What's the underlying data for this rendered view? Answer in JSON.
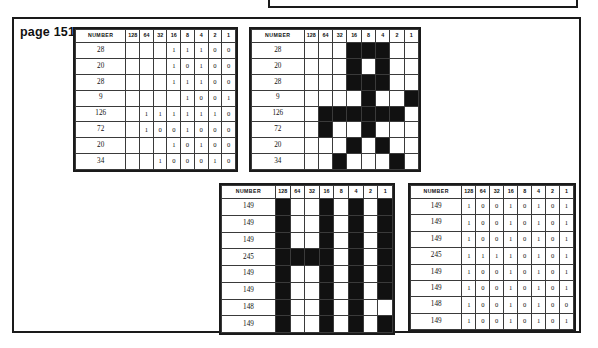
{
  "page": {
    "label_prefix": "page",
    "label_number": "151"
  },
  "columns": {
    "number_header": "NUMBER",
    "bits": [
      "128",
      "64",
      "32",
      "16",
      "8",
      "4",
      "2",
      "1"
    ]
  },
  "tables": [
    {
      "id": "top-left-binary",
      "kind": "binary-values",
      "numbers": [
        "28",
        "20",
        "28",
        "9",
        "126",
        "72",
        "20",
        "34"
      ],
      "rows": [
        [
          "",
          "",
          "",
          "1",
          "1",
          "1",
          "0",
          "0"
        ],
        [
          "",
          "",
          "",
          "1",
          "0",
          "1",
          "0",
          "0"
        ],
        [
          "",
          "",
          "",
          "1",
          "1",
          "1",
          "0",
          "0"
        ],
        [
          "",
          "",
          "",
          "",
          "1",
          "0",
          "0",
          "1"
        ],
        [
          "",
          "1",
          "1",
          "1",
          "1",
          "1",
          "1",
          "0"
        ],
        [
          "",
          "1",
          "0",
          "0",
          "1",
          "0",
          "0",
          "0"
        ],
        [
          "",
          "",
          "",
          "1",
          "0",
          "1",
          "0",
          "0"
        ],
        [
          "",
          "",
          "1",
          "0",
          "0",
          "0",
          "1",
          "0"
        ]
      ]
    },
    {
      "id": "top-right-pixels",
      "kind": "pixel-grid",
      "numbers": [
        "28",
        "20",
        "28",
        "9",
        "126",
        "72",
        "20",
        "34"
      ],
      "rows": [
        [
          0,
          0,
          0,
          1,
          1,
          1,
          0,
          0
        ],
        [
          0,
          0,
          0,
          1,
          0,
          1,
          0,
          0
        ],
        [
          0,
          0,
          0,
          1,
          1,
          1,
          0,
          0
        ],
        [
          0,
          0,
          0,
          0,
          1,
          0,
          0,
          1
        ],
        [
          0,
          1,
          1,
          1,
          1,
          1,
          1,
          0
        ],
        [
          0,
          1,
          0,
          0,
          1,
          0,
          0,
          0
        ],
        [
          0,
          0,
          0,
          1,
          0,
          1,
          0,
          0
        ],
        [
          0,
          0,
          1,
          0,
          0,
          0,
          1,
          0
        ]
      ]
    },
    {
      "id": "bottom-left-pixels",
      "kind": "pixel-grid",
      "numbers": [
        "149",
        "149",
        "149",
        "245",
        "149",
        "149",
        "148",
        "149"
      ],
      "rows": [
        [
          1,
          0,
          0,
          1,
          0,
          1,
          0,
          1
        ],
        [
          1,
          0,
          0,
          1,
          0,
          1,
          0,
          1
        ],
        [
          1,
          0,
          0,
          1,
          0,
          1,
          0,
          1
        ],
        [
          1,
          1,
          1,
          1,
          0,
          1,
          0,
          1
        ],
        [
          1,
          0,
          0,
          1,
          0,
          1,
          0,
          1
        ],
        [
          1,
          0,
          0,
          1,
          0,
          1,
          0,
          1
        ],
        [
          1,
          0,
          0,
          1,
          0,
          1,
          0,
          0
        ],
        [
          1,
          0,
          0,
          1,
          0,
          1,
          0,
          1
        ]
      ]
    },
    {
      "id": "bottom-right-binary",
      "kind": "binary-values",
      "numbers": [
        "149",
        "149",
        "149",
        "245",
        "149",
        "149",
        "148",
        "149"
      ],
      "rows": [
        [
          "1",
          "0",
          "0",
          "1",
          "0",
          "1",
          "0",
          "1"
        ],
        [
          "1",
          "0",
          "0",
          "1",
          "0",
          "1",
          "0",
          "1"
        ],
        [
          "1",
          "0",
          "0",
          "1",
          "0",
          "1",
          "0",
          "1"
        ],
        [
          "1",
          "1",
          "1",
          "1",
          "0",
          "1",
          "0",
          "1"
        ],
        [
          "1",
          "0",
          "0",
          "1",
          "0",
          "1",
          "0",
          "1"
        ],
        [
          "1",
          "0",
          "0",
          "1",
          "0",
          "1",
          "0",
          "1"
        ],
        [
          "1",
          "0",
          "0",
          "1",
          "0",
          "1",
          "0",
          "0"
        ],
        [
          "1",
          "0",
          "0",
          "1",
          "0",
          "1",
          "0",
          "1"
        ]
      ]
    }
  ],
  "colors": {
    "ink": "#111111",
    "border": "#1a1a1a",
    "grid_line": "#3a3a3a",
    "paper": "#ffffff"
  }
}
